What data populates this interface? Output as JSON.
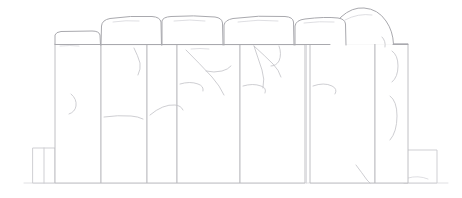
{
  "artwork": {
    "title": "Stone Wall Line Drawing",
    "subject": "masonry-wall",
    "style": "pencil-line-art",
    "background_color": "#ffffff",
    "line_color": "#b9b9bd",
    "crack_color": "#c2c2c7",
    "canvas": {
      "width": 462,
      "height": 198
    },
    "ground_line_y": 183
  },
  "capstones": [
    {
      "name": "capstone-1",
      "path": "M 55 44 L 55 35 Q 56 32 61 31.5 L 92 31 Q 99 31 100 35 L 100.5 45",
      "top_y": 31
    },
    {
      "name": "capstone-2",
      "path": "M 101 45 L 101.5 26 Q 102 20 110 18.5 Q 130 15.5 152 16.5 Q 160 17 161 22 L 161.5 45",
      "top_y": 16
    },
    {
      "name": "capstone-3",
      "path": "M 162 45 L 162 21 Q 163 17 171 16.5 Q 194 15 215 17 Q 222 18 222.5 23 L 223 45",
      "top_y": 15
    },
    {
      "name": "capstone-4",
      "path": "M 224 45 L 224 25 Q 225 20 233 18.5 Q 258 15 285 16.5 Q 293 17 293.5 22 L 294 45",
      "top_y": 15
    },
    {
      "name": "capstone-5",
      "path": "M 295 45 L 295 26 Q 296 20 305 19 Q 325 16.5 338 18 Q 345 19 345.5 24 L 346 45",
      "top_y": 16
    },
    {
      "name": "capstone-dome",
      "path": "M 330 44 Q 330 28 341 17 Q 352 7 364 8 Q 378 9 386 21 Q 393 31 393.5 44",
      "top_y": 7
    }
  ],
  "columns": [
    {
      "name": "column-1",
      "x": 55,
      "top": 44,
      "width": 46,
      "bottom": 183
    },
    {
      "name": "column-2",
      "x": 101,
      "top": 45,
      "width": 46,
      "bottom": 183
    },
    {
      "name": "column-3",
      "x": 147,
      "top": 45,
      "width": 30,
      "bottom": 183
    },
    {
      "name": "column-4",
      "x": 177,
      "top": 45,
      "width": 63,
      "bottom": 183
    },
    {
      "name": "column-5",
      "x": 240,
      "top": 45,
      "width": 65,
      "bottom": 183
    },
    {
      "name": "column-6",
      "x": 310,
      "top": 44,
      "width": 65,
      "bottom": 183
    },
    {
      "name": "column-7",
      "x": 375,
      "top": 44,
      "width": 33,
      "bottom": 183
    }
  ],
  "base_blocks": [
    {
      "name": "base-block-left",
      "x": 33,
      "y": 148,
      "width": 22,
      "height": 35
    },
    {
      "name": "base-block-right",
      "x": 404,
      "y": 150,
      "width": 33,
      "height": 33
    }
  ],
  "cracks": [
    {
      "name": "crack-left-curl",
      "path": "M 71 94 Q 77 99 76 106 Q 75 112 69 114"
    },
    {
      "name": "crack-horizontal-mid",
      "path": "M 104 117 Q 118 115 131 116 Q 138 116.5 143 119"
    },
    {
      "name": "crack-arc-right-of-mid",
      "path": "M 150 115 Q 163 104 175 105 Q 181 105.5 183 110"
    },
    {
      "name": "crack-col2-upper",
      "path": "M 134 48 Q 138 56 140 63 Q 141 69 138 75"
    },
    {
      "name": "crack-col4-branch-main",
      "path": "M 186 50 Q 200 64 212 77 Q 220 86 224 95"
    },
    {
      "name": "crack-col4-branch-2",
      "path": "M 206 71 Q 214 73 222 71 Q 228 69.5 231 66"
    },
    {
      "name": "crack-col4-squiggle",
      "path": "M 180 84 Q 190 81 198 84 Q 204 86 203 91"
    },
    {
      "name": "crack-col5-fan-1",
      "path": "M 254 46 Q 258 58 262 70 Q 265 79 263 88"
    },
    {
      "name": "crack-col5-fan-2",
      "path": "M 254 46 Q 265 56 273 64 Q 279 70 281 77"
    },
    {
      "name": "crack-col5-fan-3",
      "path": "M 279 46 Q 282 54 279 61 Q 276 66 271 66"
    },
    {
      "name": "crack-col5-squiggle",
      "path": "M 243 86 Q 253 83 261 86 Q 267 88 265 93"
    },
    {
      "name": "crack-col6-squiggle",
      "path": "M 313 86 Q 324 82 332 86 Q 338 89 335 94"
    },
    {
      "name": "crack-col6-base",
      "path": "M 356 165 Q 362 173 367 180 Q 369 182 370 183"
    },
    {
      "name": "crack-col7-flake-upper",
      "path": "M 392 51 Q 398 55 398 66 Q 398 77 392 82"
    },
    {
      "name": "crack-col7-flake-lower",
      "path": "M 390 96 Q 397 101 397 116 Q 397 132 390 140"
    },
    {
      "name": "crack-dome-seam",
      "path": "M 382 37 Q 386 41 385 47"
    }
  ],
  "texture_marks": [
    {
      "name": "texture-cap2",
      "path": "M 113 22 Q 126 20 139 21"
    },
    {
      "name": "texture-cap3",
      "path": "M 174 21 Q 190 19 205 21"
    },
    {
      "name": "texture-cap4",
      "path": "M 238 22 Q 258 19 278 21"
    },
    {
      "name": "texture-cap5",
      "path": "M 304 23 Q 320 21 334 22"
    },
    {
      "name": "texture-dome",
      "path": "M 345 20 Q 358 13 372 15"
    },
    {
      "name": "texture-col1",
      "path": "M 60 46 Q 70 45 79 46"
    },
    {
      "name": "texture-col4",
      "path": "M 191 49 Q 200 48 209 49"
    }
  ]
}
